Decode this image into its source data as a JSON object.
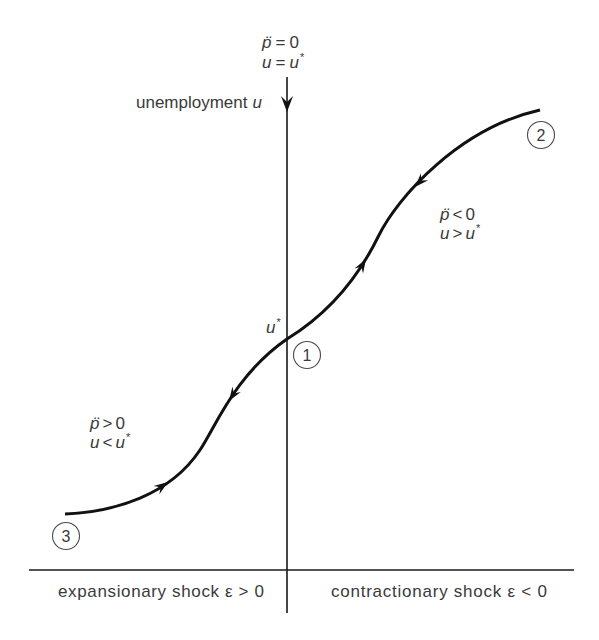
{
  "figure": {
    "y_axis": {
      "label": "unemployment",
      "variable": "u"
    },
    "x_axis": {
      "left_label": "expansionary shock ε > 0",
      "right_label": "contractionary shock ε < 0"
    },
    "equilibrium_label": {
      "variable": "u",
      "superscript": "*"
    },
    "axis_condition": {
      "line1": {
        "lhs": "p̈",
        "op": "=",
        "rhs": "0"
      },
      "line2": {
        "lhs": "u",
        "op": "=",
        "rhs": "u",
        "sup": "*"
      }
    },
    "region_upper_right": {
      "line1": {
        "lhs": "p̈",
        "op": "<",
        "rhs": "0"
      },
      "line2": {
        "lhs": "u",
        "op": ">",
        "rhs": "u",
        "sup": "*"
      }
    },
    "region_lower_left": {
      "line1": {
        "lhs": "p̈",
        "op": ">",
        "rhs": "0"
      },
      "line2": {
        "lhs": "u",
        "op": "<",
        "rhs": "u",
        "sup": "*"
      }
    },
    "points": [
      {
        "label": "1"
      },
      {
        "label": "2"
      },
      {
        "label": "3"
      }
    ],
    "colors": {
      "line": "#111111",
      "text": "#3a3a3a",
      "background": "#ffffff"
    }
  }
}
